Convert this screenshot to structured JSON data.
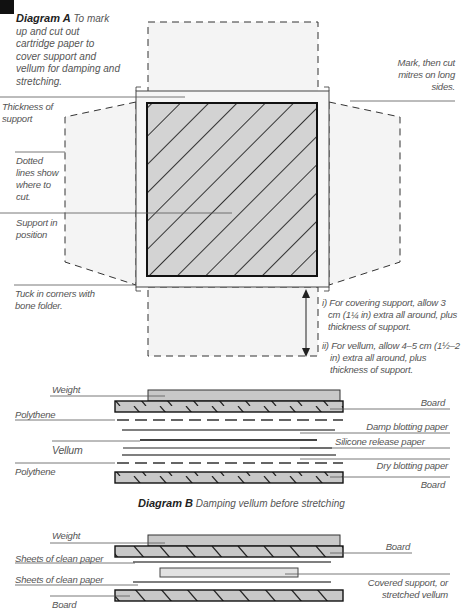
{
  "diagram_a": {
    "title": "Diagram A",
    "caption": "To mark up and cut out cartridge paper to cover support and vellum for damping and stretching.",
    "labels": {
      "mark_mitres": "Mark, then cut mitres on long sides.",
      "thickness": "Thickness of support",
      "dotted": "Dotted lines show where to cut.",
      "support": "Support in position",
      "tuck": "Tuck in corners with bone folder.",
      "note_i": "i) For covering support, allow 3 cm (1¼ in) extra all around, plus thickness of support.",
      "note_ii": "ii) For vellum, allow 4–5 cm (1½–2 in) extra all around, plus thickness of support."
    }
  },
  "diagram_b": {
    "title": "Diagram B",
    "caption": "Damping vellum before stretching",
    "labels": {
      "weight": "Weight",
      "polythene_top": "Polythene",
      "vellum": "Vellum",
      "polythene_bottom": "Polythene",
      "board_top": "Board",
      "damp_blotting": "Damp blotting paper",
      "silicone": "Silicone release paper",
      "dry_blotting": "Dry blotting paper",
      "board_bottom": "Board"
    }
  },
  "diagram_c": {
    "labels": {
      "weight": "Weight",
      "sheets_top": "Sheets of clean paper",
      "sheets_bottom": "Sheets of clean paper",
      "board_left": "Board",
      "board_right": "Board",
      "covered": "Covered support, or stretched vellum"
    }
  },
  "colors": {
    "hatch_fill": "#d0d0d0",
    "flap_fill": "#f4f4f4",
    "line": "#222222",
    "label": "#555555"
  }
}
